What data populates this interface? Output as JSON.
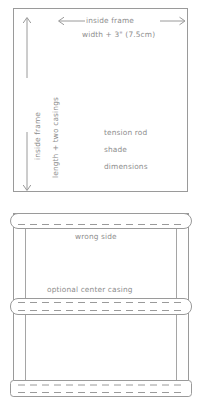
{
  "diagram": {
    "title": "tension rod shade dimensions",
    "ink_color": "#8d8d8d",
    "line_color": "#9a9a9a",
    "background": "#ffffff",
    "top_panel": {
      "name": "inside frame measurement box",
      "width_arrow": {
        "label_line1": "inside frame",
        "label_line2": "width + 3\" (7.5cm)",
        "direction": "double-headed-horizontal"
      },
      "length_arrow": {
        "label": "inside frame",
        "direction": "double-headed-vertical"
      },
      "casing_label": "length + two casings",
      "caption_lines": [
        "tension rod",
        "shade",
        "dimensions"
      ]
    },
    "bottom_panel": {
      "name": "shade construction back view",
      "labels": {
        "wrong_side": "wrong side",
        "optional_center_casing": "optional center casing"
      },
      "casings": [
        {
          "position": "top",
          "stitch": "dashed"
        },
        {
          "position": "center",
          "stitch": "dashed"
        },
        {
          "position": "bottom",
          "stitch": "dashed"
        }
      ]
    }
  }
}
